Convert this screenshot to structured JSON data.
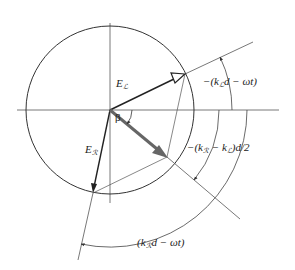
{
  "figure": {
    "colors": {
      "line": "#444444",
      "vector": "#222222",
      "resultant": "#666666",
      "background": "#ffffff"
    },
    "circle": {
      "cx": 110,
      "cy": 110,
      "r": 84
    },
    "axes": {
      "horizontal": {
        "x1": 17,
        "y1": 110,
        "x2": 279,
        "y2": 110
      },
      "vertical": {
        "x1": 110,
        "y1": 23,
        "x2": 110,
        "y2": 203
      }
    },
    "vectors": {
      "e_left": {
        "label_main": "E",
        "label_sub": "ℒ",
        "x2": 185,
        "y2": 74,
        "head": "hollow"
      },
      "e_right": {
        "label_main": "E",
        "label_sub": "ℛ",
        "x2": 93,
        "y2": 193,
        "head": "filled"
      },
      "resultant": {
        "x2": 167,
        "y2": 157,
        "head": "filled-thick"
      }
    },
    "labels": {
      "beta": "β",
      "angle_left": {
        "prefix": "−(k",
        "sub": "ℒ",
        "suffix": "d − ωt)"
      },
      "angle_half": {
        "prefix": "−(k",
        "sub1": "ℛ",
        "mid": " − k",
        "sub2": "ℒ",
        "suffix": ")d/2"
      },
      "angle_right": {
        "prefix": "(k",
        "sub": "ℛ",
        "suffix": "d − ωt)"
      }
    }
  }
}
